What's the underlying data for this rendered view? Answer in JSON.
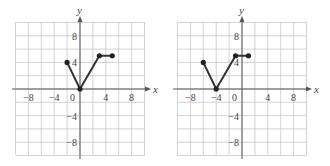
{
  "chart_data": [
    {
      "type": "line",
      "title": "",
      "xlabel": "x",
      "ylabel": "y",
      "xlim": [
        -10,
        10
      ],
      "ylim": [
        -10,
        10
      ],
      "grid": true,
      "grid_step": 2,
      "x_ticks": [
        "-8",
        "-4",
        "0",
        "4",
        "8"
      ],
      "y_ticks": [
        "8",
        "4",
        "-4",
        "-8"
      ],
      "points": [
        [
          -2,
          4
        ],
        [
          0,
          0
        ],
        [
          3,
          5
        ],
        [
          5,
          5
        ]
      ]
    },
    {
      "type": "line",
      "title": "",
      "xlabel": "x",
      "ylabel": "y",
      "xlim": [
        -10,
        10
      ],
      "ylim": [
        -10,
        10
      ],
      "grid": true,
      "grid_step": 2,
      "x_ticks": [
        "-8",
        "-4",
        "0",
        "4",
        "8"
      ],
      "y_ticks": [
        "8",
        "4",
        "-4",
        "-8"
      ],
      "points": [
        [
          -6,
          4
        ],
        [
          -4,
          0
        ],
        [
          -1,
          5
        ],
        [
          1,
          5
        ]
      ]
    }
  ],
  "graphs": [
    {
      "x_axis_label": "x",
      "y_axis_label": "y",
      "x_tick_labels": [
        "−8",
        "−4",
        "0",
        "4",
        "8"
      ],
      "y_tick_labels": [
        "8",
        "4",
        "−4",
        "−8"
      ]
    },
    {
      "x_axis_label": "x",
      "y_axis_label": "y",
      "x_tick_labels": [
        "−8",
        "−4",
        "0",
        "4",
        "8"
      ],
      "y_tick_labels": [
        "8",
        "4",
        "−4",
        "−8"
      ]
    }
  ]
}
